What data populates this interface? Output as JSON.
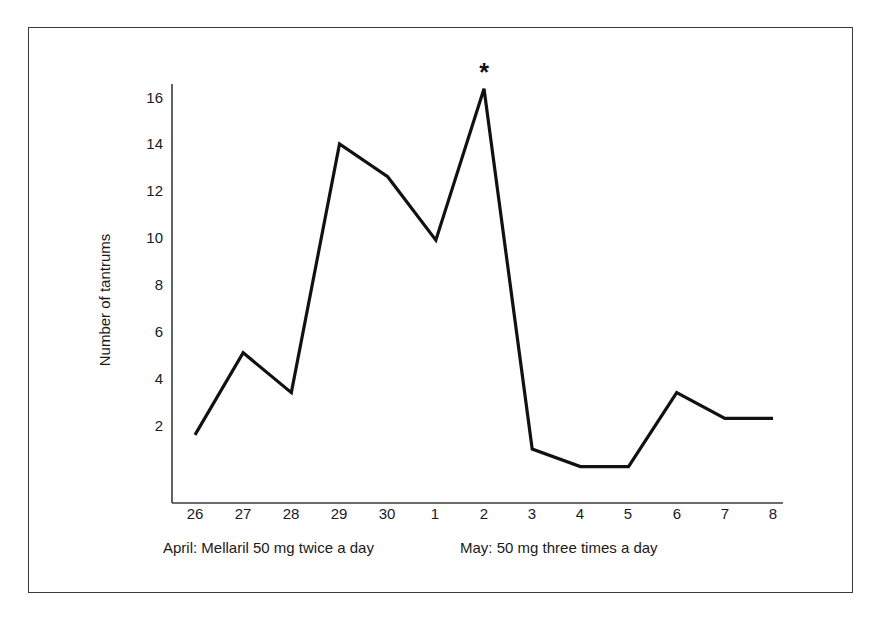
{
  "chart_data": {
    "type": "line",
    "title": "",
    "xlabel": "",
    "ylabel": "Number of tantrums",
    "categories": [
      "26",
      "27",
      "28",
      "29",
      "30",
      "1",
      "2",
      "3",
      "4",
      "5",
      "6",
      "7",
      "8"
    ],
    "values": [
      1.6,
      5.1,
      3.4,
      14.0,
      12.6,
      9.9,
      16.35,
      1.0,
      0.25,
      0.25,
      3.4,
      2.3,
      2.3
    ],
    "ytick_labels": [
      "2",
      "4",
      "6",
      "8",
      "10",
      "12",
      "14",
      "16"
    ],
    "ytick_values": [
      2,
      4,
      6,
      8,
      10,
      12,
      14,
      16
    ],
    "ylim": [
      0,
      17.2
    ],
    "xlim_index": [
      0,
      12
    ],
    "grid": false,
    "legend": "none",
    "series": [
      {
        "name": "Number of tantrums",
        "color": "#111111",
        "values": [
          1.6,
          5.1,
          3.4,
          14.0,
          12.6,
          9.9,
          16.35,
          1.0,
          0.25,
          0.25,
          3.4,
          2.3,
          2.3
        ]
      }
    ],
    "annotations": [
      {
        "marker": "*",
        "at_category": "2",
        "at_value": 16.35,
        "note": "asterisk above peak at May 2"
      }
    ]
  },
  "captions": {
    "left": "April: Mellaril 50 mg twice a day",
    "right": "May: 50 mg three times a day"
  },
  "axis": {
    "y_title": "Number of tantrums"
  }
}
